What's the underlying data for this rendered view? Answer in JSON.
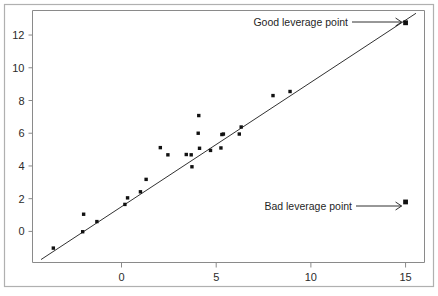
{
  "chart_data": {
    "type": "scatter",
    "title": "",
    "xlabel": "",
    "ylabel": "",
    "xlim": [
      -4.7,
      16.0
    ],
    "ylim": [
      -1.9,
      13.5
    ],
    "xticks": [
      0,
      5,
      10,
      15
    ],
    "xtick_labels": [
      "0",
      "5",
      "10",
      "15"
    ],
    "yticks": [
      0,
      2,
      4,
      6,
      8,
      10,
      12
    ],
    "ytick_labels": [
      "0",
      "2",
      "4",
      "6",
      "8",
      "10",
      "12"
    ],
    "grid": false,
    "legend": "none",
    "series": [
      {
        "name": "observations",
        "marker": "filled-square",
        "points": [
          [
            -3.6,
            -1.02
          ],
          [
            -2.05,
            -0.02
          ],
          [
            -2.0,
            1.05
          ],
          [
            -1.3,
            0.6
          ],
          [
            0.18,
            1.65
          ],
          [
            0.32,
            2.05
          ],
          [
            1.0,
            2.42
          ],
          [
            1.3,
            3.18
          ],
          [
            2.05,
            5.12
          ],
          [
            2.45,
            4.68
          ],
          [
            3.42,
            4.7
          ],
          [
            3.68,
            4.68
          ],
          [
            3.72,
            3.95
          ],
          [
            4.08,
            7.08
          ],
          [
            4.05,
            6.0
          ],
          [
            4.12,
            5.08
          ],
          [
            4.7,
            4.95
          ],
          [
            5.25,
            5.1
          ],
          [
            5.3,
            5.92
          ],
          [
            5.38,
            5.95
          ],
          [
            6.22,
            5.95
          ],
          [
            6.32,
            6.38
          ],
          [
            8.0,
            8.3
          ],
          [
            8.9,
            8.55
          ]
        ]
      },
      {
        "name": "good-leverage-point",
        "marker": "filled-square-large",
        "points": [
          [
            15.0,
            12.75
          ]
        ]
      },
      {
        "name": "bad-leverage-point",
        "marker": "filled-square-large",
        "points": [
          [
            15.0,
            1.8
          ]
        ]
      }
    ],
    "regression_line": {
      "name": "fitted-line",
      "x_start": -4.25,
      "y_start": -1.72,
      "x_end": 15.55,
      "y_end": 13.33
    },
    "annotations": [
      {
        "id": "good-leverage",
        "text": "Good leverage point",
        "target_x": 15.0,
        "target_y": 12.75
      },
      {
        "id": "bad-leverage",
        "text": "Bad leverage point",
        "target_x": 15.0,
        "target_y": 1.8
      }
    ]
  },
  "figure": {
    "background": "#ffffff",
    "axis_color": "#8a8a8a",
    "point_color": "#111111",
    "line_color": "#1a1a1a",
    "frame_color": "#b0b0b0"
  }
}
